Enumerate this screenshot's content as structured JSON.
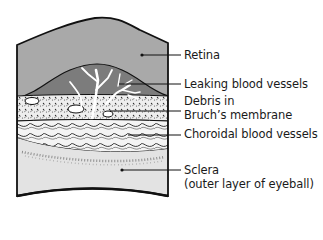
{
  "diagram": {
    "labels": {
      "retina": "Retina",
      "leaking_vessels": "Leaking blood vessels",
      "debris_line1": "Debris in",
      "debris_line2": "Bruch’s membrane",
      "choroidal": "Choroidal blood vessels",
      "sclera_line1": "Sclera",
      "sclera_line2": "(outer layer of eyeball)"
    },
    "colors": {
      "retina_fill": "#a9a9a9",
      "bulge_fill": "#7c7c7c",
      "sclera_fill": "#e3e3e3",
      "outline": "#111111",
      "vessels": "#ffffff"
    }
  }
}
